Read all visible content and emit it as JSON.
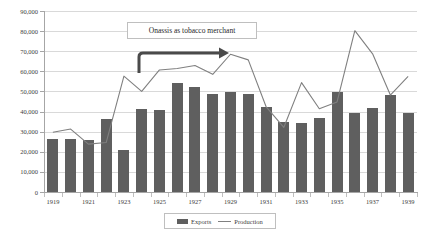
{
  "chart_data": {
    "type": "bar",
    "title": "",
    "subtitle": "",
    "xlabel": "",
    "ylabel": "",
    "ylim": [
      0,
      90000
    ],
    "yticks": [
      0,
      10000,
      20000,
      30000,
      40000,
      50000,
      60000,
      70000,
      80000,
      90000
    ],
    "ytick_labels": [
      "0",
      "10,000",
      "20,000",
      "30,000",
      "40,000",
      "50,000",
      "60,000",
      "70,000",
      "80,000",
      "90,000"
    ],
    "grid": true,
    "legend_position": "bottom",
    "categories": [
      "1919",
      "1920",
      "1921",
      "1922",
      "1923",
      "1924",
      "1925",
      "1926",
      "1927",
      "1928",
      "1929",
      "1930",
      "1931",
      "1932",
      "1933",
      "1934",
      "1935",
      "1936",
      "1937",
      "1938",
      "1939"
    ],
    "xtick_labels": [
      "1919",
      "1921",
      "1923",
      "1925",
      "1927",
      "1929",
      "1931",
      "1933",
      "1935",
      "1937",
      "1939"
    ],
    "series": [
      {
        "name": "Exports",
        "type": "bar",
        "color": "#5f5f5f",
        "values": [
          26500,
          26400,
          25700,
          36100,
          21100,
          41400,
          40800,
          54300,
          52300,
          48500,
          49600,
          48800,
          42500,
          34700,
          34100,
          36900,
          49700,
          39500,
          41700,
          48300,
          39400
        ]
      },
      {
        "name": "Production",
        "type": "line",
        "color": "#808080",
        "values": [
          29700,
          31300,
          23800,
          24600,
          57600,
          50000,
          60700,
          61400,
          62900,
          58500,
          68500,
          65700,
          42500,
          32100,
          54400,
          41400,
          44800,
          80200,
          68700,
          48200,
          57500
        ]
      }
    ],
    "annotations": [
      {
        "name": "callout",
        "text": "Onassis as tobacco merchant",
        "arrow": "elbow-right"
      }
    ]
  },
  "legend": {
    "items": [
      {
        "label": "Exports",
        "marker": "bar-swatch"
      },
      {
        "label": "Production",
        "marker": "line-swatch"
      }
    ]
  }
}
